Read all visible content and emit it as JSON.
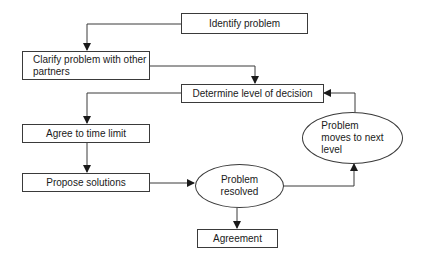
{
  "diagram": {
    "type": "flowchart",
    "colors": {
      "stroke": "#3a3a3a",
      "text": "#1a1a1a",
      "background": "#ffffff"
    },
    "nodes": {
      "identify": {
        "label": "Identify problem",
        "shape": "rectangle"
      },
      "clarify": {
        "label": "Clarify problem with other partners",
        "line1": "Clarify problem with other",
        "line2": "partners",
        "shape": "rectangle"
      },
      "determine": {
        "label": "Determine level of decision",
        "shape": "rectangle"
      },
      "agree_time": {
        "label": "Agree to time limit",
        "shape": "rectangle"
      },
      "propose": {
        "label": "Propose solutions",
        "shape": "rectangle"
      },
      "resolved": {
        "label": "Problem resolved",
        "line1": "Problem",
        "line2": "resolved",
        "shape": "ellipse"
      },
      "next_level": {
        "label": "Problem moves to next level",
        "line1": "Problem",
        "line2": "moves to next",
        "line3": "level",
        "shape": "ellipse"
      },
      "agreement": {
        "label": "Agreement",
        "shape": "rectangle"
      }
    },
    "edges": [
      {
        "from": "Identify problem",
        "to": "Clarify problem with other partners"
      },
      {
        "from": "Clarify problem with other partners",
        "to": "Determine level of decision"
      },
      {
        "from": "Determine level of decision",
        "to": "Agree to time limit"
      },
      {
        "from": "Agree to time limit",
        "to": "Propose solutions"
      },
      {
        "from": "Propose solutions",
        "to": "Problem resolved"
      },
      {
        "from": "Problem resolved",
        "to": "Agreement"
      },
      {
        "from": "Problem resolved",
        "to": "Problem moves to next level"
      },
      {
        "from": "Problem moves to next level",
        "to": "Determine level of decision"
      }
    ]
  }
}
